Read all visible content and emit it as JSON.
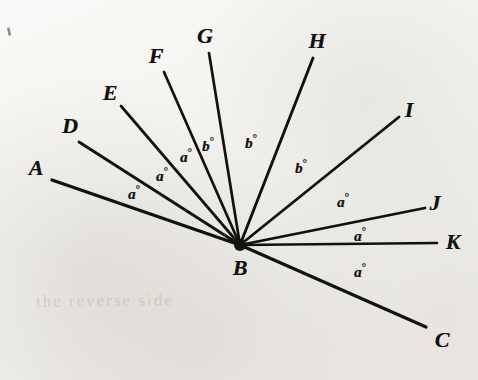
{
  "figure": {
    "vertex": {
      "name": "B",
      "label": "B",
      "x": 240,
      "y": 245,
      "label_x": 240,
      "label_y": 268
    },
    "ink_color": "#131110",
    "paper_color": "#f4f3f0",
    "width": 478,
    "height": 380,
    "rays": [
      {
        "name": "A",
        "label": "A",
        "tip_x": 52,
        "tip_y": 180,
        "label_x": 36,
        "label_y": 168,
        "stroke": 3.4
      },
      {
        "name": "D",
        "label": "D",
        "tip_x": 79,
        "tip_y": 142,
        "label_x": 70,
        "label_y": 126,
        "stroke": 2.9
      },
      {
        "name": "E",
        "label": "E",
        "tip_x": 121,
        "tip_y": 106,
        "label_x": 110,
        "label_y": 93,
        "stroke": 2.7
      },
      {
        "name": "F",
        "label": "F",
        "tip_x": 164,
        "tip_y": 72,
        "label_x": 156,
        "label_y": 56,
        "stroke": 2.7
      },
      {
        "name": "G",
        "label": "G",
        "tip_x": 209,
        "tip_y": 53,
        "label_x": 205,
        "label_y": 36,
        "stroke": 2.7
      },
      {
        "name": "H",
        "label": "H",
        "tip_x": 313,
        "tip_y": 58,
        "label_x": 317,
        "label_y": 41,
        "stroke": 2.9
      },
      {
        "name": "I",
        "label": "I",
        "tip_x": 399,
        "tip_y": 117,
        "label_x": 409,
        "label_y": 110,
        "stroke": 2.8
      },
      {
        "name": "J",
        "label": "J",
        "tip_x": 425,
        "tip_y": 208,
        "label_x": 435,
        "label_y": 203,
        "stroke": 2.8
      },
      {
        "name": "K",
        "label": "K",
        "tip_x": 437,
        "tip_y": 243,
        "label_x": 453,
        "label_y": 242,
        "stroke": 2.6
      },
      {
        "name": "C",
        "label": "C",
        "tip_x": 426,
        "tip_y": 327,
        "label_x": 442,
        "label_y": 340,
        "stroke": 3.2
      }
    ],
    "angle_labels": [
      {
        "name": "angle-A-D",
        "value": "a",
        "unit": "°",
        "x": 134,
        "y": 193,
        "between": [
          "A",
          "D"
        ]
      },
      {
        "name": "angle-D-E",
        "value": "a",
        "unit": "°",
        "x": 162,
        "y": 175,
        "between": [
          "D",
          "E"
        ]
      },
      {
        "name": "angle-E-F",
        "value": "a",
        "unit": "°",
        "x": 186,
        "y": 156,
        "between": [
          "E",
          "F"
        ]
      },
      {
        "name": "angle-F-G",
        "value": "b",
        "unit": "°",
        "x": 208,
        "y": 145,
        "between": [
          "F",
          "G"
        ]
      },
      {
        "name": "angle-G-H",
        "value": "b",
        "unit": "°",
        "x": 251,
        "y": 142,
        "between": [
          "G",
          "H"
        ]
      },
      {
        "name": "angle-H-I",
        "value": "b",
        "unit": "°",
        "x": 301,
        "y": 167,
        "between": [
          "H",
          "I"
        ]
      },
      {
        "name": "angle-I-J",
        "value": "a",
        "unit": "°",
        "x": 343,
        "y": 201,
        "between": [
          "I",
          "J"
        ]
      },
      {
        "name": "angle-J-K",
        "value": "a",
        "unit": "°",
        "x": 360,
        "y": 235,
        "between": [
          "J",
          "K"
        ]
      },
      {
        "name": "angle-K-C",
        "value": "a",
        "unit": "°",
        "x": 360,
        "y": 271,
        "between": [
          "K",
          "C"
        ]
      }
    ],
    "stray_marks": [
      {
        "name": "corner-tick",
        "x": 7,
        "y": 28,
        "w": 2.5,
        "h": 8,
        "rotate": -12
      }
    ],
    "bleed_through_text": [
      {
        "name": "bleed-line",
        "text": "the  reverse  side",
        "x": 36,
        "y": 291
      }
    ]
  }
}
